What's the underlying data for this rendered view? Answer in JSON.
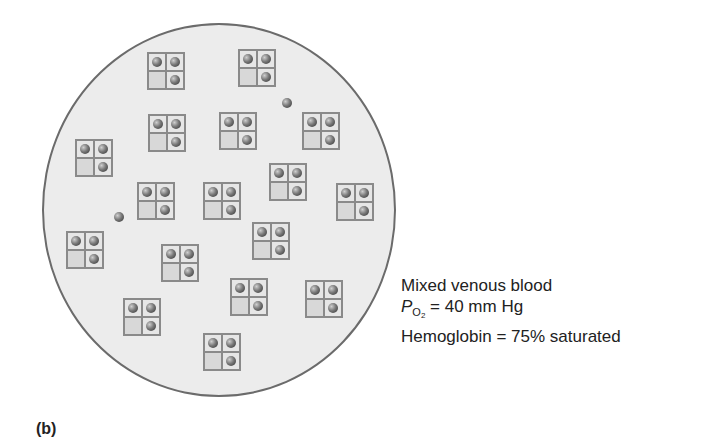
{
  "figure": {
    "panel_label": "(b)",
    "caption": {
      "line1": "Mixed venous blood",
      "line2_symbol": "P",
      "line2_sub": "O",
      "line2_subsub": "2",
      "line2_value": " = 40 mm Hg",
      "line3": "Hemoglobin = 75% saturated"
    },
    "colors": {
      "circle_fill": "#ececec",
      "circle_border": "#6b6b6b",
      "box_border": "#8a8a8a",
      "cell_fill": "#e6e6e6",
      "empty_cell_fill": "#d8d8d8",
      "oxygen_ball": "#3a3a3a"
    },
    "hemoglobin_pattern": "3 of 4 sites bound (top-left, top-right, bottom-right); bottom-left empty",
    "hemoglobin_molecules": [
      {
        "x": 147,
        "y": 52
      },
      {
        "x": 238,
        "y": 49
      },
      {
        "x": 148,
        "y": 114
      },
      {
        "x": 219,
        "y": 112
      },
      {
        "x": 302,
        "y": 112
      },
      {
        "x": 75,
        "y": 139
      },
      {
        "x": 269,
        "y": 163
      },
      {
        "x": 137,
        "y": 182
      },
      {
        "x": 203,
        "y": 182
      },
      {
        "x": 336,
        "y": 183
      },
      {
        "x": 252,
        "y": 222
      },
      {
        "x": 66,
        "y": 231
      },
      {
        "x": 161,
        "y": 244
      },
      {
        "x": 230,
        "y": 278
      },
      {
        "x": 305,
        "y": 280
      },
      {
        "x": 123,
        "y": 298
      },
      {
        "x": 203,
        "y": 333
      }
    ],
    "free_oxygen": [
      {
        "x": 282,
        "y": 98
      },
      {
        "x": 114,
        "y": 212
      }
    ]
  }
}
